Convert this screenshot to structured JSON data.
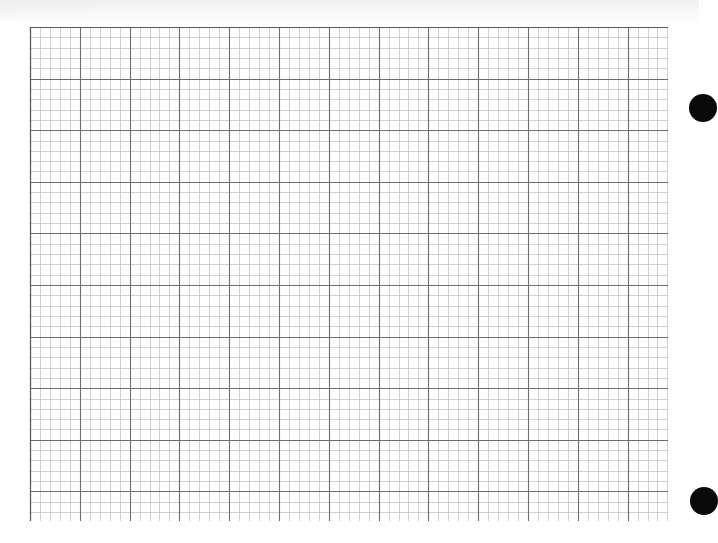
{
  "sheet": {
    "type": "graph-paper",
    "width": 699,
    "height": 543,
    "background": "#ffffff"
  },
  "grid": {
    "left": 30,
    "top": 27,
    "right": 668,
    "bottom": 521,
    "major_spacing_x": 49.8,
    "major_spacing_y": 51.6,
    "minor_divisions": 5,
    "major_color": "#6e6e6e",
    "minor_color": "#c4c4c4",
    "major_width": 1.1,
    "minor_width": 0.8,
    "top_border_color": "#5a5a5a"
  },
  "binder_holes": [
    {
      "name": "binder-hole-top",
      "cx": 703,
      "cy": 108,
      "r": 14,
      "color": "#0a0a0a"
    },
    {
      "name": "binder-hole-bottom",
      "cx": 704,
      "cy": 501,
      "r": 14,
      "color": "#0a0a0a"
    }
  ]
}
